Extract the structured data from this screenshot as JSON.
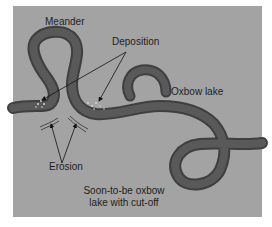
{
  "diagram": {
    "labels": {
      "meander": "Meander",
      "deposition": "Deposition",
      "oxbow_lake": "Oxbow lake",
      "erosion": "Erosion",
      "soon_oxbow_line1": "Soon-to-be oxbow",
      "soon_oxbow_line2": "lake with cut-off"
    },
    "colors": {
      "background": "#a3a3a3",
      "river": "#555555",
      "river_edge": "#3f3f3f",
      "deposit": "#d0d0d0",
      "text": "#1e1e1e"
    }
  }
}
